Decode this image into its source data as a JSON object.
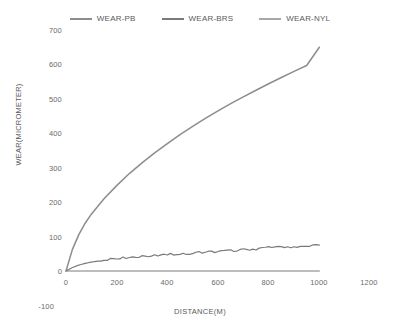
{
  "chart_data": {
    "type": "line",
    "title": "",
    "xlabel": "DISTANCE(M)",
    "ylabel": "WEAR(MICROMETER)",
    "xlim": [
      0,
      1200
    ],
    "ylim": [
      -100,
      700
    ],
    "xticks": [
      0,
      200,
      400,
      600,
      800,
      1000,
      1200
    ],
    "yticks": [
      -100,
      0,
      100,
      200,
      300,
      400,
      500,
      600,
      700
    ],
    "xtick_labels": [
      "0",
      "200",
      "400",
      "600",
      "800",
      "1000",
      "1200"
    ],
    "ytick_labels": [
      "-100",
      "0",
      "100",
      "200",
      "300",
      "400",
      "500",
      "600",
      "700"
    ],
    "grid": false,
    "legend_position": "top-center",
    "x": [
      0,
      25,
      50,
      75,
      100,
      150,
      200,
      250,
      300,
      350,
      400,
      450,
      500,
      550,
      600,
      650,
      700,
      750,
      800,
      850,
      900,
      950,
      1000
    ],
    "series": [
      {
        "name": "WEAR-PB",
        "color": "#8d8d8d",
        "values": [
          0,
          62,
          105,
          138,
          165,
          210,
          248,
          283,
          314,
          343,
          370,
          396,
          420,
          443,
          465,
          486,
          506,
          525,
          544,
          562,
          580,
          597,
          650
        ]
      },
      {
        "name": "WEAR-BRS",
        "color": "#7a7a7a",
        "values": [
          0,
          10,
          17,
          22,
          26,
          32,
          37,
          40,
          43,
          45,
          48,
          50,
          52,
          55,
          57,
          59,
          62,
          64,
          68,
          70,
          70,
          73,
          75
        ]
      },
      {
        "name": "WEAR-NYL",
        "color": "#a8a8a8",
        "values": [
          0,
          0,
          0,
          0,
          0,
          0,
          0,
          0,
          0,
          0,
          0,
          0,
          0,
          0,
          0,
          0,
          0,
          0,
          0,
          0,
          0,
          0,
          0
        ]
      }
    ]
  },
  "legend": {
    "items": [
      {
        "label": "WEAR-PB",
        "color": "#8d8d8d"
      },
      {
        "label": "WEAR-BRS",
        "color": "#7a7a7a"
      },
      {
        "label": "WEAR-NYL",
        "color": "#a8a8a8"
      }
    ]
  },
  "axes": {
    "y_title": "WEAR(MICROMETER)",
    "x_title": "DISTANCE(M)",
    "y_labels": [
      "700",
      "600",
      "500",
      "400",
      "300",
      "200",
      "100",
      "0",
      "-100"
    ],
    "x_labels": [
      "0",
      "200",
      "400",
      "600",
      "800",
      "1000",
      "1200"
    ]
  }
}
